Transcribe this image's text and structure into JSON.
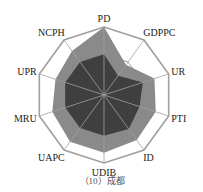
{
  "chart_data": {
    "type": "radar",
    "title": "",
    "caption": "（10）成都",
    "axes": [
      "PD",
      "GDPPC",
      "UR",
      "PTI",
      "ID",
      "UDIB",
      "UAPC",
      "MRU",
      "UPR",
      "NCPH"
    ],
    "range": [
      0,
      1
    ],
    "grid_rings": [
      1.0,
      0.6
    ],
    "series": [
      {
        "name": "outer",
        "color": "#8a8a8a",
        "values": [
          1.0,
          0.55,
          0.78,
          0.8,
          0.82,
          0.85,
          0.85,
          0.8,
          0.75,
          0.8
        ]
      },
      {
        "name": "inner",
        "color": "#3f3f3f",
        "values": [
          0.6,
          0.35,
          0.6,
          0.55,
          0.62,
          0.6,
          0.6,
          0.6,
          0.6,
          0.6
        ]
      }
    ]
  },
  "colors": {
    "grid": "#a0a0a0",
    "outer": "#8a8a8a",
    "inner": "#3f3f3f"
  }
}
